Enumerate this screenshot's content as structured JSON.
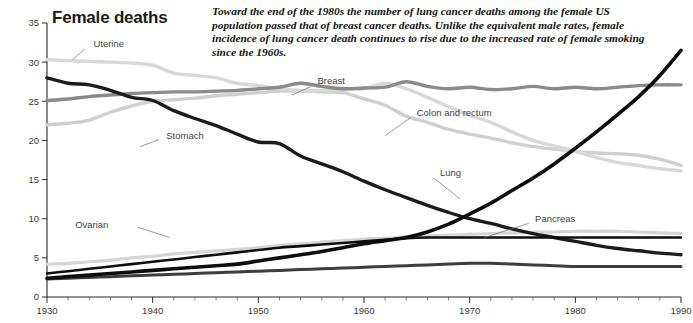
{
  "header": {
    "title": "Female deaths",
    "annotation": "Toward the end of the 1980s the number of lung cancer deaths among the female US population passed that of breast cancer deaths. Unlike the equivalent male rates, female incidence of lung cancer death continues to rise due to the increased rate of female smoking since the 1960s."
  },
  "chart_data": {
    "type": "line",
    "title": "Female deaths",
    "xlabel": "",
    "ylabel": "",
    "xlim": [
      1930,
      1990
    ],
    "ylim": [
      0,
      35
    ],
    "xticks": [
      1930,
      1940,
      1950,
      1960,
      1970,
      1980,
      1990
    ],
    "xtick_labels": [
      "1930",
      "1940",
      "1950",
      "1960",
      "1970",
      "1980",
      "1990"
    ],
    "yticks": [
      0,
      5,
      10,
      15,
      20,
      25,
      30,
      35
    ],
    "ytick_labels": [
      "0",
      "5",
      "10",
      "15",
      "20",
      "25",
      "30",
      "35"
    ],
    "minor_x_step": 2,
    "grid": false,
    "legend": "inline-labels",
    "x": [
      1930,
      1932,
      1934,
      1936,
      1938,
      1940,
      1942,
      1944,
      1946,
      1948,
      1950,
      1952,
      1954,
      1956,
      1958,
      1960,
      1962,
      1964,
      1966,
      1968,
      1970,
      1972,
      1974,
      1976,
      1978,
      1980,
      1982,
      1984,
      1986,
      1988,
      1990
    ],
    "series": [
      {
        "name": "Uterine",
        "color": "#d8d8d8",
        "width": 3.4,
        "label_x": 1934.2,
        "label_y": 32.4,
        "leader": [
          [
            1933.6,
            31.7
          ],
          [
            1932.4,
            30.3
          ]
        ],
        "values": [
          30.3,
          30.2,
          30.1,
          30.0,
          29.9,
          29.6,
          28.6,
          28.3,
          28.0,
          27.3,
          27.0,
          26.6,
          26.4,
          26.4,
          26.5,
          26.6,
          27.3,
          26.6,
          25.5,
          24.3,
          23.2,
          22.3,
          21.1,
          20.0,
          19.3,
          18.6,
          17.8,
          17.2,
          16.8,
          16.4,
          16.1
        ]
      },
      {
        "name": "Breast",
        "color": "#8a8a8a",
        "width": 3.4,
        "label_x": 1955.4,
        "label_y": 27.6,
        "leader": [
          [
            1955.0,
            26.9
          ],
          [
            1953.2,
            25.8
          ]
        ],
        "values": [
          25.1,
          25.3,
          25.6,
          25.8,
          26.0,
          26.1,
          26.2,
          26.2,
          26.3,
          26.4,
          26.6,
          26.8,
          27.3,
          26.9,
          26.6,
          26.7,
          26.8,
          27.5,
          26.9,
          26.6,
          26.8,
          26.5,
          26.6,
          26.9,
          26.6,
          26.8,
          26.6,
          26.8,
          27.0,
          27.1,
          27.1
        ]
      },
      {
        "name": "Stomach",
        "color": "#1c1c1c",
        "width": 3.4,
        "label_x": 1941.1,
        "label_y": 20.6,
        "leader": [
          [
            1940.6,
            20.1
          ],
          [
            1938.8,
            19.2
          ]
        ],
        "values": [
          28.0,
          27.3,
          27.1,
          26.4,
          25.5,
          25.1,
          23.8,
          22.8,
          21.9,
          20.8,
          19.8,
          19.6,
          18.0,
          17.0,
          16.0,
          14.8,
          13.7,
          12.7,
          11.7,
          10.8,
          10.0,
          9.4,
          8.7,
          8.1,
          7.6,
          7.1,
          6.6,
          6.2,
          5.9,
          5.6,
          5.4
        ]
      },
      {
        "name": "Colon and rectum",
        "color": "#cfcfcf",
        "width": 3.4,
        "label_x": 1964.8,
        "label_y": 23.6,
        "leader": [
          [
            1964.4,
            22.9
          ],
          [
            1962.0,
            20.6
          ]
        ],
        "values": [
          22.0,
          22.2,
          22.6,
          23.6,
          24.4,
          25.0,
          25.2,
          25.4,
          25.7,
          25.9,
          26.1,
          26.3,
          26.3,
          26.2,
          26.1,
          25.3,
          24.5,
          23.1,
          22.3,
          21.4,
          20.8,
          20.3,
          19.7,
          19.2,
          18.9,
          18.6,
          18.4,
          18.3,
          18.1,
          17.6,
          16.8
        ]
      },
      {
        "name": "Lung",
        "color": "#0d0d0d",
        "width": 3.6,
        "label_x": 1967.0,
        "label_y": 15.9,
        "leader": [
          [
            1966.6,
            15.2
          ],
          [
            1969.1,
            12.5
          ]
        ],
        "values": [
          2.4,
          2.6,
          2.8,
          3.0,
          3.2,
          3.4,
          3.6,
          3.8,
          4.0,
          4.2,
          4.6,
          5.0,
          5.4,
          5.8,
          6.3,
          6.8,
          7.2,
          7.6,
          8.3,
          9.3,
          10.6,
          12.0,
          13.6,
          15.2,
          17.0,
          19.0,
          21.1,
          23.3,
          25.6,
          28.3,
          31.5
        ]
      },
      {
        "name": "Ovarian",
        "color": "#d5d5d5",
        "width": 3.2,
        "label_x": 1936.0,
        "label_y": 9.3,
        "leader": [
          [
            1938.6,
            8.9
          ],
          [
            1941.6,
            7.6
          ]
        ],
        "values": [
          4.2,
          4.3,
          4.5,
          4.7,
          5.0,
          5.2,
          5.5,
          5.7,
          5.9,
          6.1,
          6.3,
          6.6,
          6.8,
          7.0,
          7.2,
          7.4,
          7.5,
          7.7,
          7.8,
          7.9,
          8.0,
          8.1,
          8.2,
          8.3,
          8.3,
          8.4,
          8.4,
          8.4,
          8.3,
          8.2,
          8.1
        ]
      },
      {
        "name": "Pancreas",
        "color": "#0d0d0d",
        "width": 2.6,
        "label_x": 1976.0,
        "label_y": 10.0,
        "leader": [
          [
            1975.6,
            9.4
          ],
          [
            1971.4,
            7.6
          ]
        ],
        "values": [
          3.0,
          3.3,
          3.6,
          3.9,
          4.2,
          4.5,
          4.8,
          5.1,
          5.4,
          5.7,
          6.0,
          6.3,
          6.5,
          6.7,
          6.9,
          7.1,
          7.3,
          7.5,
          7.6,
          7.6,
          7.6,
          7.6,
          7.6,
          7.6,
          7.6,
          7.6,
          7.6,
          7.6,
          7.6,
          7.6,
          7.6
        ]
      },
      {
        "name": "Uterine lower",
        "color": "#3d3d3d",
        "width": 3.0,
        "label_x": null,
        "label_y": null,
        "leader": null,
        "values": [
          2.3,
          2.4,
          2.5,
          2.6,
          2.7,
          2.8,
          2.9,
          3.0,
          3.1,
          3.2,
          3.3,
          3.4,
          3.5,
          3.6,
          3.7,
          3.8,
          3.9,
          4.0,
          4.1,
          4.2,
          4.3,
          4.3,
          4.2,
          4.1,
          4.0,
          3.9,
          3.9,
          3.9,
          3.9,
          3.9,
          3.9
        ]
      }
    ]
  }
}
